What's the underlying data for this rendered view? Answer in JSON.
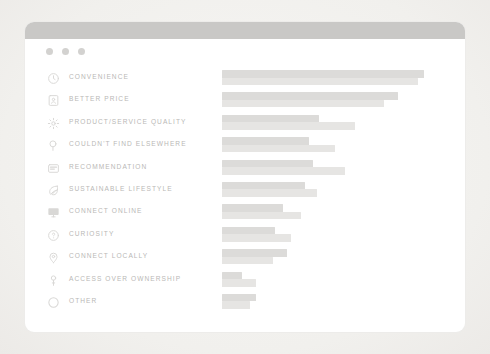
{
  "window": {
    "controls": [
      "close-dot",
      "minimize-dot",
      "maximize-dot"
    ]
  },
  "chart_data": {
    "type": "bar",
    "orientation": "horizontal",
    "title": "",
    "subtitle": "",
    "xlabel": "",
    "ylabel": "",
    "grid": false,
    "legend": null,
    "axis_labels_visible": false,
    "value_labels_visible": false,
    "xlim": [
      0,
      100
    ],
    "categories": [
      "CONVENIENCE",
      "BETTER PRICE",
      "PRODUCT/SERVICE QUALITY",
      "COULDN'T FIND ELSEWHERE",
      "RECOMMENDATION",
      "SUSTAINABLE LIFESTYLE",
      "CONNECT ONLINE",
      "CURIOSITY",
      "CONNECT LOCALLY",
      "ACCESS OVER OWNERSHIP",
      "OTHER"
    ],
    "series": [
      {
        "name": "series-primary",
        "color": "#dcdbd9",
        "values": [
          100,
          87,
          48,
          43,
          45,
          41,
          30,
          26,
          32,
          10,
          17
        ]
      },
      {
        "name": "series-secondary",
        "color": "#e6e5e3",
        "values": [
          97,
          80,
          66,
          56,
          61,
          47,
          39,
          34,
          25,
          17,
          14
        ]
      }
    ],
    "icons": [
      "clock-icon",
      "bookmark-icon",
      "gear-icon",
      "search-icon",
      "chat-card-icon",
      "leaf-icon",
      "monitor-icon",
      "lightbulb-icon",
      "map-pin-icon",
      "key-icon",
      "circle-icon"
    ]
  },
  "colors": {
    "page_background": "#f3f2f0",
    "card_background": "#ffffff",
    "title_bar": "#c9c8c6",
    "dot": "#d3d2d0",
    "label_text": "#b9b8b6",
    "icon": "#d9d8d6",
    "bar_primary": "#dcdbd9",
    "bar_secondary": "#e6e5e3"
  }
}
